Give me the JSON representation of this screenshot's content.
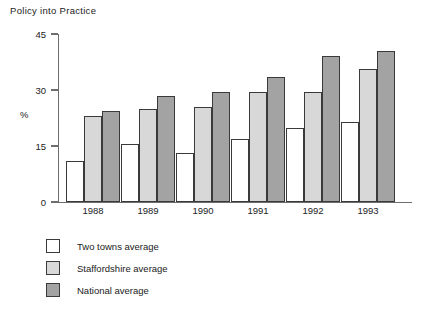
{
  "chart_data": {
    "type": "bar",
    "title": "Policy into Practice",
    "xlabel": "",
    "ylabel": "%",
    "categories": [
      "1988",
      "1989",
      "1990",
      "1991",
      "1992",
      "1993"
    ],
    "ylim": [
      0,
      45
    ],
    "yticks": [
      0,
      15,
      30,
      45
    ],
    "grid": false,
    "legend_position": "below-left",
    "series": [
      {
        "name": "Two towns average",
        "color": "#ffffff",
        "values": [
          11,
          15.5,
          13,
          17,
          19.8,
          21.5
        ]
      },
      {
        "name": "Staffordshire average",
        "color": "#d8d8d8",
        "values": [
          23,
          25,
          25.5,
          29.5,
          29.5,
          35.5
        ]
      },
      {
        "name": "National average",
        "color": "#a3a3a3",
        "values": [
          24.5,
          28.5,
          29.5,
          33.5,
          39,
          40.5
        ]
      }
    ]
  }
}
